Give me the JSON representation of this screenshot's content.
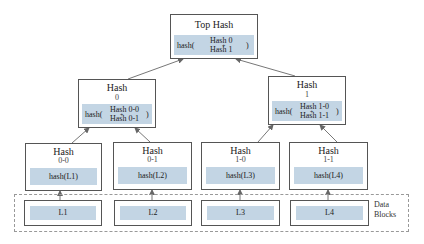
{
  "diagram": {
    "type": "merkle-tree",
    "colors": {
      "hash_fill": "#c3d5e4",
      "border": "#555555",
      "dashed_border": "#999999"
    },
    "root": {
      "title": "Top Hash",
      "fn": "hash(",
      "inputs": [
        "Hash 0",
        "Hash 1"
      ],
      "plus": "+",
      "close": ")"
    },
    "level1": [
      {
        "title": "Hash",
        "index": "0",
        "fn": "hash(",
        "inputs": [
          "Hash 0-0",
          "Hash 0-1"
        ],
        "plus": "+",
        "close": ")"
      },
      {
        "title": "Hash",
        "index": "1",
        "fn": "hash(",
        "inputs": [
          "Hash 1-0",
          "Hash 1-1"
        ],
        "plus": "+",
        "close": ")"
      }
    ],
    "leaves": [
      {
        "title": "Hash",
        "index": "0-0",
        "value": "hash(L1)"
      },
      {
        "title": "Hash",
        "index": "0-1",
        "value": "hash(L2)"
      },
      {
        "title": "Hash",
        "index": "1-0",
        "value": "hash(L3)"
      },
      {
        "title": "Hash",
        "index": "1-1",
        "value": "hash(L4)"
      }
    ],
    "data_blocks": {
      "label_line1": "Data",
      "label_line2": "Blocks",
      "items": [
        "L1",
        "L2",
        "L3",
        "L4"
      ]
    }
  }
}
